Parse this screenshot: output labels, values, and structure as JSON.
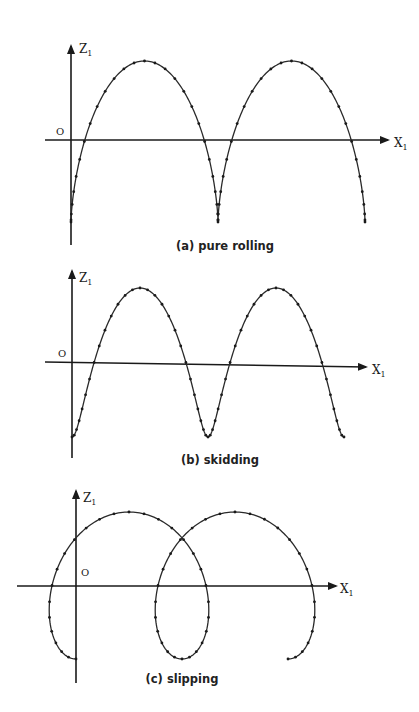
{
  "figure": {
    "panels": [
      {
        "id": "a",
        "caption": "(a) pure rolling",
        "y_axis_label": "Z",
        "y_axis_sub": "1",
        "x_axis_label": "X",
        "x_axis_sub": "1",
        "origin_label": "O",
        "motion": "pure rolling (cycloid with cusps)"
      },
      {
        "id": "b",
        "caption": "(b) skidding",
        "y_axis_label": "Z",
        "y_axis_sub": "1",
        "x_axis_label": "X",
        "x_axis_sub": "1",
        "origin_label": "O",
        "motion": "skidding (curtate trochoid)"
      },
      {
        "id": "c",
        "caption": "(c) slipping",
        "y_axis_label": "Z",
        "y_axis_sub": "1",
        "x_axis_label": "X",
        "x_axis_sub": "1",
        "origin_label": "O",
        "motion": "slipping (prolate trochoid with loops)"
      }
    ]
  },
  "chart_data": [
    {
      "type": "line",
      "title": "(a) pure rolling",
      "xlabel": "X1",
      "ylabel": "Z1",
      "curve": "cycloid",
      "params": {
        "x0": 71,
        "period_px": 147,
        "z_base_px": 222,
        "amplitude_px": 80.5,
        "ratio": 1.0,
        "theta_max": 12.566
      },
      "features": {
        "cusps": 3,
        "arches": 2
      },
      "axes_px": {
        "origin": [
          71,
          140
        ],
        "x_end": 390,
        "x_start": 45,
        "y_top": 44,
        "y_bottom": 245
      }
    },
    {
      "type": "line",
      "title": "(b) skidding",
      "xlabel": "X1",
      "ylabel": "Z1",
      "curve": "curtate trochoid",
      "params": {
        "x0": 72,
        "period_px": 136,
        "z_base_px": 437,
        "amplitude_px": 74.5,
        "ratio": 0.55,
        "theta_max": 12.566
      },
      "features": {
        "troughs": 3,
        "peaks": 2
      },
      "axes_px": {
        "origin": [
          72,
          362
        ],
        "x_end": 368,
        "x_start": 45,
        "y_top": 270,
        "y_bottom": 458
      }
    },
    {
      "type": "line",
      "title": "(c) slipping",
      "xlabel": "X1",
      "ylabel": "Z1",
      "curve": "prolate trochoid",
      "params": {
        "x0": 76,
        "period_px": 106,
        "z_base_px": 659,
        "amplitude_px": 73.5,
        "ratio": 2.99,
        "theta_max": 12.566
      },
      "features": {
        "loops": 3,
        "peaks": 2
      },
      "axes_px": {
        "origin": [
          76,
          586
        ],
        "x_end": 338,
        "x_start": 17,
        "y_top": 490,
        "y_bottom": 683
      }
    }
  ]
}
